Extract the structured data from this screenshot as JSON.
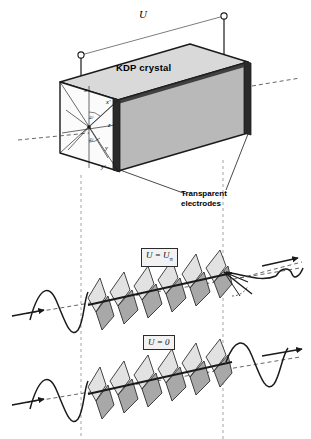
{
  "figure": {
    "background_color": "#ffffff",
    "ink_color": "#1a1a1a",
    "width": 311,
    "height": 439
  },
  "circuit": {
    "voltage_label": "U",
    "terminal_count": 2,
    "terminal_left": {
      "x": 81,
      "y": 55
    },
    "terminal_right": {
      "x": 224,
      "y": 16
    }
  },
  "crystal": {
    "label": "KDP crystal",
    "top_face_color": "#d9d9d9",
    "right_face_color": "#b9b9b9",
    "front_face_color": "#fbfbfb",
    "edge_color": "#1a1a1a",
    "electrode_color": "#2a2a2a"
  },
  "electrodes": {
    "label_line1": "Transparent",
    "label_line2": "electrodes",
    "count": 2
  },
  "axes": {
    "items": [
      {
        "name": "x",
        "label": "x"
      },
      {
        "name": "x-prime",
        "label": "x'"
      },
      {
        "name": "y",
        "label": "y"
      },
      {
        "name": "y-prime",
        "label": "y'"
      },
      {
        "name": "z",
        "label": "z"
      }
    ],
    "angles": [
      {
        "name": "angle-upper",
        "label": "45°"
      },
      {
        "name": "angle-lower",
        "label": "45°"
      }
    ]
  },
  "waves": {
    "upper": {
      "voltage_label": "U = U",
      "voltage_subscript": "π",
      "state": "half-wave voltage applied",
      "input_polarization": "linear",
      "output_polarization": "linear rotated 90°",
      "helix_lobes": 6
    },
    "lower": {
      "voltage_label": "U = 0",
      "voltage_subscript": "",
      "state": "no voltage applied",
      "input_polarization": "linear",
      "output_polarization": "linear unchanged",
      "helix_lobes": 6
    },
    "lobe_light_color": "#e2e2e2",
    "lobe_dark_color": "#a8a8a8",
    "guide_color": "#9a9a9a"
  }
}
